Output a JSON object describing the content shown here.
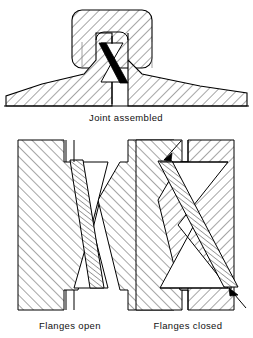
{
  "figure": {
    "background_color": "#ffffff",
    "line_color": "#000000",
    "hatch_color": "#3a3a3a",
    "gasket_fill_color": "#000000",
    "panels": [
      {
        "id": "joint-assembled",
        "caption": "Joint assembled",
        "caption_x": 126,
        "caption_y": 121,
        "description": "Assembled flanged joint with hatched upper clamp cap, tapered flange faces and a dark inclined gasket between hourglass seating surfaces"
      },
      {
        "id": "flanges-open",
        "caption": "Flanges open",
        "caption_x": 70,
        "caption_y": 329,
        "description": "Flanges separated showing hatched gasket leaning to the left between the two hourglass cavity walls"
      },
      {
        "id": "flanges-closed",
        "caption": "Flanges closed",
        "caption_x": 188,
        "caption_y": 329,
        "description": "Flanges brought together compressing the hatched gasket, with two load arrows indicating contact points"
      }
    ],
    "annotations": [
      {
        "id": "arrow-upper-left",
        "panel": "flanges-closed",
        "label": ""
      },
      {
        "id": "arrow-lower-right",
        "panel": "flanges-closed",
        "label": ""
      }
    ]
  }
}
